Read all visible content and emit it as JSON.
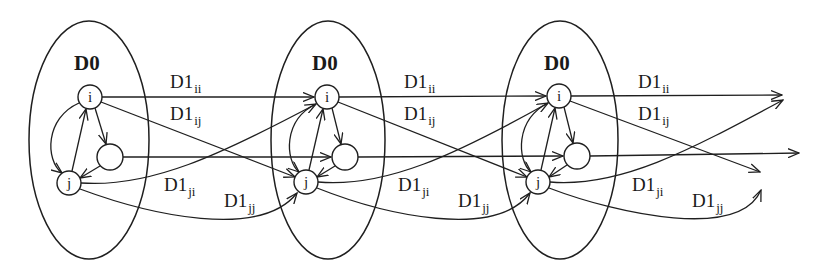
{
  "diagram": {
    "groups": [
      {
        "label": "D0",
        "nodes": {
          "i": "i",
          "j": "j",
          "mid": ""
        }
      },
      {
        "label": "D0",
        "nodes": {
          "i": "i",
          "j": "j",
          "mid": ""
        }
      },
      {
        "label": "D0",
        "nodes": {
          "i": "i",
          "j": "j",
          "mid": ""
        }
      }
    ],
    "edge_labels": [
      [
        {
          "base": "D1",
          "sub": "ii"
        },
        {
          "base": "D1",
          "sub": "ij"
        },
        {
          "base": "D1",
          "sub": "ji"
        },
        {
          "base": "D1",
          "sub": "jj"
        }
      ],
      [
        {
          "base": "D1",
          "sub": "ii"
        },
        {
          "base": "D1",
          "sub": "ij"
        },
        {
          "base": "D1",
          "sub": "ji"
        },
        {
          "base": "D1",
          "sub": "jj"
        }
      ],
      [
        {
          "base": "D1",
          "sub": "ii"
        },
        {
          "base": "D1",
          "sub": "ij"
        },
        {
          "base": "D1",
          "sub": "ji"
        },
        {
          "base": "D1",
          "sub": "jj"
        }
      ]
    ],
    "colors": {
      "stroke": "#1f1f1f",
      "background": "#ffffff"
    }
  }
}
